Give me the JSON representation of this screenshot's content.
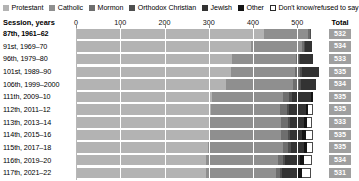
{
  "legend": {
    "items": [
      {
        "label": "Protestant",
        "color": "#b3b3b3",
        "swatch": "filled"
      },
      {
        "label": "Catholic",
        "color": "#8f8f8f",
        "swatch": "filled"
      },
      {
        "label": "Mormon",
        "color": "#6e6e6e",
        "swatch": "filled"
      },
      {
        "label": "Orthodox Christian",
        "color": "#4f4f4f",
        "swatch": "filled"
      },
      {
        "label": "Jewish",
        "color": "#333333",
        "swatch": "filled"
      },
      {
        "label": "Other",
        "color": "#141414",
        "swatch": "filled"
      },
      {
        "label": "Don't know/refused to say",
        "color": "#ffffff",
        "swatch": "open"
      }
    ]
  },
  "header": {
    "session_label": "Session, years",
    "total_label": "Total"
  },
  "chart_data": {
    "type": "bar",
    "title": "",
    "subtitle": "",
    "xlabel": "",
    "ylabel": "Session, years",
    "orientation": "horizontal",
    "stacked": true,
    "grid": true,
    "legend_position": "top",
    "xlim": [
      0,
      540
    ],
    "xticks": [
      0,
      100,
      200,
      300,
      400,
      500
    ],
    "xtick_labels": [
      "0",
      "100",
      "200",
      "300",
      "400",
      "500"
    ],
    "categories": [
      "87th, 1961–62",
      "91st, 1969–70",
      "96th, 1979–80",
      "101st, 1989–90",
      "106th, 1999–2000",
      "111th, 2009–10",
      "112th, 2011–12",
      "113th, 2013–14",
      "114th, 2015–16",
      "115th, 2017–18",
      "116th, 2019–20",
      "117th, 2021–22"
    ],
    "series": [
      {
        "name": "Protestant",
        "color": "#b3b3b3",
        "values": [
          425,
          396,
          352,
          350,
          338,
          307,
          305,
          300,
          300,
          299,
          294,
          293
        ]
      },
      {
        "name": "Catholic",
        "color": "#8f8f8f",
        "values": [
          99,
          114,
          144,
          145,
          152,
          160,
          156,
          163,
          164,
          168,
          163,
          158
        ]
      },
      {
        "name": "Mormon",
        "color": "#6e6e6e",
        "values": [
          5,
          6,
          9,
          12,
          14,
          15,
          15,
          15,
          14,
          13,
          11,
          10
        ]
      },
      {
        "name": "Orthodox Christian",
        "color": "#4f4f4f",
        "values": [
          1,
          2,
          2,
          3,
          4,
          5,
          5,
          5,
          5,
          5,
          5,
          5
        ]
      },
      {
        "name": "Jewish",
        "color": "#333333",
        "values": [
          2,
          16,
          28,
          38,
          34,
          45,
          39,
          32,
          28,
          30,
          34,
          33
        ]
      },
      {
        "name": "Other",
        "color": "#141414",
        "values": [
          0,
          0,
          0,
          0,
          0,
          3,
          5,
          6,
          8,
          8,
          9,
          12
        ]
      },
      {
        "name": "Don't know/refused to say",
        "color": "#ffffff",
        "values": [
          0,
          0,
          0,
          0,
          0,
          0,
          10,
          12,
          16,
          12,
          18,
          20
        ]
      }
    ],
    "totals": [
      532,
      534,
      533,
      535,
      534,
      535,
      535,
      533,
      535,
      535,
      534,
      531
    ]
  }
}
